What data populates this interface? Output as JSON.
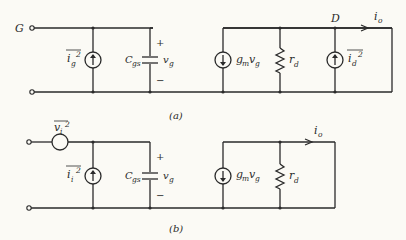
{
  "diagram": {
    "type": "small-signal noise equivalent circuit (FET)",
    "panels": [
      {
        "id": "a",
        "caption": "(a)",
        "input_terminal_label": "G",
        "output_node_label": "D",
        "gate_noise_source": {
          "base": "i",
          "sub": "g",
          "sup": "2"
        },
        "capacitor": {
          "base": "C",
          "sub": "gs"
        },
        "voltage": {
          "base": "v",
          "sub": "g",
          "plus": "+",
          "minus": "−"
        },
        "dependent_source": {
          "g": "g",
          "gsub": "m",
          "v": "v",
          "vsub": "g"
        },
        "resistor": {
          "base": "r",
          "sub": "d"
        },
        "drain_noise_source": {
          "base": "i",
          "sub": "d",
          "sup": "2"
        },
        "output_current": {
          "base": "i",
          "sub": "o"
        }
      },
      {
        "id": "b",
        "caption": "(b)",
        "input_voltage_noise": {
          "base": "v",
          "sub": "i",
          "sup": "2"
        },
        "input_current_noise": {
          "base": "i",
          "sub": "i",
          "sup": "2"
        },
        "capacitor": {
          "base": "C",
          "sub": "gs"
        },
        "voltage": {
          "base": "v",
          "sub": "g",
          "plus": "+",
          "minus": "−"
        },
        "dependent_source": {
          "g": "g",
          "gsub": "m",
          "v": "v",
          "vsub": "g"
        },
        "resistor": {
          "base": "r",
          "sub": "d"
        },
        "output_current": {
          "base": "i",
          "sub": "o"
        }
      }
    ]
  }
}
